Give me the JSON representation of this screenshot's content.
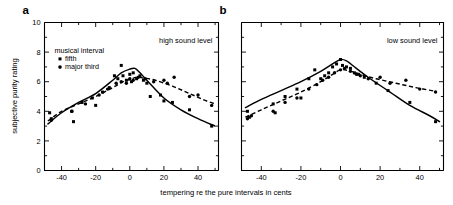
{
  "figure": {
    "panels": [
      {
        "letter": "a",
        "annotation": "high sound level"
      },
      {
        "letter": "b",
        "annotation": "low sound level"
      }
    ],
    "ylabel": "subjective purity rating",
    "xlabel": "tempering re the pure intervals in cents",
    "legend": {
      "title": "musical interval",
      "entries": [
        {
          "label": "fifth",
          "marker": "square",
          "line": "solid"
        },
        {
          "label": "major third",
          "marker": "circle",
          "line": "dashed"
        }
      ]
    },
    "colors": {
      "ink": "#000000",
      "background": "#ffffff"
    }
  },
  "chart_data": [
    {
      "type": "scatter",
      "id": "panel-a",
      "title": "high sound level",
      "xlabel": "tempering re the pure intervals in cents",
      "ylabel": "subjective purity rating",
      "xlim": [
        -50,
        52
      ],
      "ylim": [
        0,
        10
      ],
      "xticks": [
        -40,
        -20,
        0,
        20,
        40
      ],
      "xminorticks": [
        -50,
        -30,
        -10,
        10,
        30,
        50
      ],
      "yticks": [
        0,
        2,
        4,
        6,
        8,
        10
      ],
      "yminorticks": [
        1,
        3,
        5,
        7,
        9
      ],
      "grid": false,
      "legend_position": "upper-left",
      "series": [
        {
          "name": "fifth",
          "marker": "square",
          "line": "solid",
          "points": [
            {
              "x": -47,
              "y": 3.9
            },
            {
              "x": -46,
              "y": 3.5
            },
            {
              "x": -34,
              "y": 4.0
            },
            {
              "x": -33,
              "y": 3.3
            },
            {
              "x": -28,
              "y": 4.6
            },
            {
              "x": -22,
              "y": 4.9
            },
            {
              "x": -20,
              "y": 4.4
            },
            {
              "x": -16,
              "y": 5.3
            },
            {
              "x": -12,
              "y": 5.6
            },
            {
              "x": -9,
              "y": 6.4
            },
            {
              "x": -7,
              "y": 6.2
            },
            {
              "x": -5,
              "y": 7.1
            },
            {
              "x": -4,
              "y": 6.4
            },
            {
              "x": -2,
              "y": 6.1
            },
            {
              "x": 0,
              "y": 6.5
            },
            {
              "x": 1,
              "y": 6.0
            },
            {
              "x": 2,
              "y": 6.6
            },
            {
              "x": 4,
              "y": 6.2
            },
            {
              "x": 6,
              "y": 6.4
            },
            {
              "x": 8,
              "y": 6.1
            },
            {
              "x": 10,
              "y": 5.9
            },
            {
              "x": 12,
              "y": 5.0
            },
            {
              "x": 18,
              "y": 5.1
            },
            {
              "x": 20,
              "y": 4.7
            },
            {
              "x": 25,
              "y": 4.6
            },
            {
              "x": 35,
              "y": 4.1
            },
            {
              "x": 48,
              "y": 3.0
            }
          ],
          "fit": [
            {
              "x": -48,
              "y": 3.15
            },
            {
              "x": -40,
              "y": 3.9
            },
            {
              "x": -30,
              "y": 4.6
            },
            {
              "x": -20,
              "y": 5.2
            },
            {
              "x": -10,
              "y": 6.1
            },
            {
              "x": -5,
              "y": 6.6
            },
            {
              "x": 0,
              "y": 6.85
            },
            {
              "x": 3,
              "y": 6.9
            },
            {
              "x": 6,
              "y": 6.6
            },
            {
              "x": 10,
              "y": 6.1
            },
            {
              "x": 20,
              "y": 4.9
            },
            {
              "x": 30,
              "y": 4.1
            },
            {
              "x": 40,
              "y": 3.5
            },
            {
              "x": 50,
              "y": 3.0
            }
          ]
        },
        {
          "name": "major third",
          "marker": "circle",
          "line": "dashed",
          "points": [
            {
              "x": -46,
              "y": 3.4
            },
            {
              "x": -34,
              "y": 4.0
            },
            {
              "x": -26,
              "y": 4.5
            },
            {
              "x": -18,
              "y": 5.1
            },
            {
              "x": -13,
              "y": 5.5
            },
            {
              "x": -8,
              "y": 5.9
            },
            {
              "x": -5,
              "y": 6.0
            },
            {
              "x": -2,
              "y": 5.9
            },
            {
              "x": 0,
              "y": 6.2
            },
            {
              "x": 2,
              "y": 6.1
            },
            {
              "x": 5,
              "y": 6.3
            },
            {
              "x": 9,
              "y": 6.2
            },
            {
              "x": 14,
              "y": 6.0
            },
            {
              "x": 20,
              "y": 6.1
            },
            {
              "x": 22,
              "y": 5.9
            },
            {
              "x": 26,
              "y": 6.3
            },
            {
              "x": 35,
              "y": 5.0
            },
            {
              "x": 40,
              "y": 5.1
            },
            {
              "x": 48,
              "y": 4.4
            }
          ],
          "fit": [
            {
              "x": -48,
              "y": 3.35
            },
            {
              "x": -40,
              "y": 4.0
            },
            {
              "x": -30,
              "y": 4.5
            },
            {
              "x": -20,
              "y": 5.0
            },
            {
              "x": -10,
              "y": 5.6
            },
            {
              "x": -4,
              "y": 6.0
            },
            {
              "x": 0,
              "y": 6.15
            },
            {
              "x": 4,
              "y": 6.3
            },
            {
              "x": 8,
              "y": 6.25
            },
            {
              "x": 15,
              "y": 6.1
            },
            {
              "x": 25,
              "y": 5.7
            },
            {
              "x": 35,
              "y": 5.2
            },
            {
              "x": 45,
              "y": 4.7
            },
            {
              "x": 50,
              "y": 4.5
            }
          ]
        }
      ]
    },
    {
      "type": "scatter",
      "id": "panel-b",
      "title": "low sound level",
      "xlabel": "tempering re the pure intervals in cents",
      "ylabel": "subjective purity rating",
      "xlim": [
        -50,
        52
      ],
      "ylim": [
        0,
        10
      ],
      "xticks": [
        -40,
        -20,
        0,
        20,
        40
      ],
      "xminorticks": [
        -50,
        -30,
        -10,
        10,
        30,
        50
      ],
      "yticks": [
        0,
        2,
        4,
        6,
        8,
        10
      ],
      "yminorticks": [
        1,
        3,
        5,
        7,
        9
      ],
      "grid": false,
      "legend_position": "none",
      "series": [
        {
          "name": "fifth",
          "marker": "square",
          "line": "solid",
          "points": [
            {
              "x": -47,
              "y": 4.0
            },
            {
              "x": -46,
              "y": 3.6
            },
            {
              "x": -34,
              "y": 4.5
            },
            {
              "x": -33,
              "y": 3.9
            },
            {
              "x": -28,
              "y": 5.0
            },
            {
              "x": -22,
              "y": 5.5
            },
            {
              "x": -20,
              "y": 4.9
            },
            {
              "x": -16,
              "y": 6.2
            },
            {
              "x": -13,
              "y": 6.8
            },
            {
              "x": -10,
              "y": 6.2
            },
            {
              "x": -8,
              "y": 6.4
            },
            {
              "x": -6,
              "y": 6.6
            },
            {
              "x": -4,
              "y": 7.0
            },
            {
              "x": -2,
              "y": 7.2
            },
            {
              "x": 0,
              "y": 7.5
            },
            {
              "x": 1,
              "y": 7.1
            },
            {
              "x": 3,
              "y": 7.0
            },
            {
              "x": 5,
              "y": 6.9
            },
            {
              "x": 7,
              "y": 6.6
            },
            {
              "x": 9,
              "y": 6.5
            },
            {
              "x": 12,
              "y": 6.3
            },
            {
              "x": 18,
              "y": 5.9
            },
            {
              "x": 24,
              "y": 5.4
            },
            {
              "x": 35,
              "y": 4.6
            },
            {
              "x": 48,
              "y": 3.3
            }
          ],
          "fit": [
            {
              "x": -48,
              "y": 4.25
            },
            {
              "x": -40,
              "y": 4.8
            },
            {
              "x": -30,
              "y": 5.4
            },
            {
              "x": -20,
              "y": 6.0
            },
            {
              "x": -10,
              "y": 6.7
            },
            {
              "x": -4,
              "y": 7.2
            },
            {
              "x": 0,
              "y": 7.5
            },
            {
              "x": 3,
              "y": 7.4
            },
            {
              "x": 8,
              "y": 6.9
            },
            {
              "x": 15,
              "y": 6.2
            },
            {
              "x": 25,
              "y": 5.3
            },
            {
              "x": 35,
              "y": 4.4
            },
            {
              "x": 45,
              "y": 3.7
            },
            {
              "x": 50,
              "y": 3.3
            }
          ]
        },
        {
          "name": "major third",
          "marker": "circle",
          "line": "dashed",
          "points": [
            {
              "x": -47,
              "y": 3.5
            },
            {
              "x": -45,
              "y": 3.7
            },
            {
              "x": -34,
              "y": 4.0
            },
            {
              "x": -28,
              "y": 4.6
            },
            {
              "x": -22,
              "y": 4.9
            },
            {
              "x": -16,
              "y": 5.5
            },
            {
              "x": -12,
              "y": 5.8
            },
            {
              "x": -9,
              "y": 6.1
            },
            {
              "x": -6,
              "y": 6.3
            },
            {
              "x": -3,
              "y": 6.6
            },
            {
              "x": 0,
              "y": 6.8
            },
            {
              "x": 2,
              "y": 6.9
            },
            {
              "x": 5,
              "y": 6.7
            },
            {
              "x": 8,
              "y": 6.5
            },
            {
              "x": 10,
              "y": 6.4
            },
            {
              "x": 14,
              "y": 6.2
            },
            {
              "x": 20,
              "y": 6.3
            },
            {
              "x": 25,
              "y": 5.9
            },
            {
              "x": 33,
              "y": 6.1
            },
            {
              "x": 40,
              "y": 5.5
            },
            {
              "x": 48,
              "y": 5.3
            }
          ],
          "fit": [
            {
              "x": -48,
              "y": 3.6
            },
            {
              "x": -40,
              "y": 4.1
            },
            {
              "x": -30,
              "y": 4.7
            },
            {
              "x": -20,
              "y": 5.3
            },
            {
              "x": -10,
              "y": 6.0
            },
            {
              "x": -4,
              "y": 6.5
            },
            {
              "x": 0,
              "y": 6.8
            },
            {
              "x": 4,
              "y": 6.75
            },
            {
              "x": 10,
              "y": 6.5
            },
            {
              "x": 18,
              "y": 6.2
            },
            {
              "x": 28,
              "y": 5.9
            },
            {
              "x": 38,
              "y": 5.6
            },
            {
              "x": 48,
              "y": 5.35
            }
          ]
        }
      ]
    }
  ]
}
